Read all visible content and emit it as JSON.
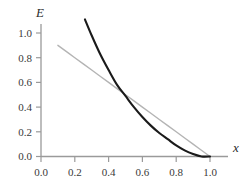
{
  "figure": {
    "background_color": "#ffffff",
    "width": 252,
    "height": 190
  },
  "chart_data": {
    "type": "line",
    "title": "",
    "subtitle": "",
    "xlabel": "x",
    "ylabel": "E",
    "xlim": [
      0.0,
      1.0
    ],
    "ylim": [
      0.0,
      1.15
    ],
    "grid": false,
    "legend": null,
    "legend_position": "none",
    "xticks": [
      0.0,
      0.2,
      0.4,
      0.6,
      0.8,
      1.0
    ],
    "xtick_labels": [
      "0.0",
      "0.2",
      "0.4",
      "0.6",
      "0.8",
      "1.0"
    ],
    "yticks": [
      0.0,
      0.2,
      0.4,
      0.6,
      0.8,
      1.0
    ],
    "ytick_labels": [
      "0.0",
      "0.2",
      "0.4",
      "0.6",
      "0.8",
      "1.0"
    ],
    "axis_color": "#9a9a9a",
    "series": [
      {
        "name": "gray-line",
        "style": "solid",
        "color": "#b4b4b4",
        "width": 1.4,
        "x": [
          0.1,
          0.2,
          0.3,
          0.4,
          0.5,
          0.6,
          0.7,
          0.8,
          0.9,
          1.0
        ],
        "values": [
          0.9,
          0.8,
          0.7,
          0.6,
          0.5,
          0.4,
          0.3,
          0.2,
          0.1,
          0.0
        ]
      },
      {
        "name": "black-curve",
        "style": "solid",
        "color": "#1a1a1a",
        "width": 2.1,
        "x": [
          0.26,
          0.3,
          0.35,
          0.4,
          0.45,
          0.5,
          0.55,
          0.6,
          0.65,
          0.7,
          0.75,
          0.8,
          0.85,
          0.9,
          0.95,
          1.0
        ],
        "values": [
          1.11,
          0.98,
          0.83,
          0.7,
          0.58,
          0.49,
          0.4,
          0.32,
          0.25,
          0.19,
          0.14,
          0.09,
          0.05,
          0.02,
          0.0,
          0.0
        ]
      }
    ],
    "annotations": [
      {
        "name": "crossing-point",
        "x": 0.52,
        "y": 0.48,
        "text": ""
      }
    ]
  }
}
